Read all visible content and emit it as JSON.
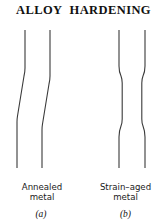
{
  "figure": {
    "title": "ALLOY  HARDENING",
    "background_color": "#ffffff",
    "line_color": "#3a3a3a",
    "text_color": "#111111"
  },
  "panels": [
    {
      "id": "a",
      "marker": "(a)",
      "caption_line_1": "Annealed",
      "caption_line_2": "metal",
      "description": "diffuse-neck-specimen"
    },
    {
      "id": "b",
      "marker": "(b)",
      "caption_line_1": "Strain–aged",
      "caption_line_2": "metal",
      "description": "luders-band-specimen"
    }
  ],
  "geometry": {
    "annealed": {
      "left_edge": "M25,30 L25,70 L17,120 L17,168",
      "right_edge": "M50,30 L50,78 L42,128 L42,168"
    },
    "strain_aged": {
      "left_edge": "M119,30 L119,68 L122,80 L122,122 L119,138 L119,168",
      "right_edge": "M145,30 L145,68 L142,80 L142,122 L145,138 L145,168"
    }
  }
}
